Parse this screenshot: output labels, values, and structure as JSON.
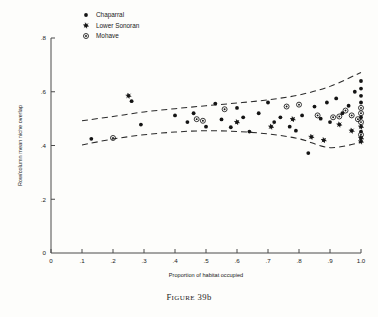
{
  "caption": {
    "prefix": "F",
    "rest": "IGURE",
    "number": " 39b"
  },
  "legend": {
    "position": "top-left-inside",
    "entries": [
      {
        "label": "Chaparral",
        "marker": "filled-dot"
      },
      {
        "label": "Lower Sonoran",
        "marker": "star-dot"
      },
      {
        "label": "Mohave",
        "marker": "circled-dot"
      }
    ]
  },
  "chart_data": {
    "type": "scatter",
    "title": "",
    "xlabel": "Proportion of habitat occupied",
    "ylabel": "Row/column mean niche overlap",
    "xlim": [
      0,
      1.0
    ],
    "ylim": [
      0,
      0.8
    ],
    "grid": false,
    "xticks": [
      0,
      0.1,
      0.2,
      0.3,
      0.4,
      0.5,
      0.6,
      0.7,
      0.8,
      0.9,
      1.0
    ],
    "xticklabels": [
      "0",
      ".1",
      ".2",
      ".3",
      ".4",
      ".5",
      ".6",
      ".7",
      ".8",
      ".9",
      "1.0"
    ],
    "yticks": [
      0,
      0.2,
      0.4,
      0.6,
      0.8
    ],
    "yticklabels": [
      "0",
      ".2",
      ".4",
      ".6",
      ".8"
    ],
    "series": [
      {
        "name": "Chaparral",
        "marker": "filled-dot",
        "points": [
          [
            0.13,
            0.425
          ],
          [
            0.26,
            0.565
          ],
          [
            0.29,
            0.478
          ],
          [
            0.4,
            0.512
          ],
          [
            0.44,
            0.487
          ],
          [
            0.46,
            0.52
          ],
          [
            0.5,
            0.47
          ],
          [
            0.53,
            0.556
          ],
          [
            0.55,
            0.497
          ],
          [
            0.58,
            0.468
          ],
          [
            0.6,
            0.54
          ],
          [
            0.62,
            0.505
          ],
          [
            0.64,
            0.452
          ],
          [
            0.67,
            0.52
          ],
          [
            0.7,
            0.56
          ],
          [
            0.72,
            0.487
          ],
          [
            0.74,
            0.505
          ],
          [
            0.77,
            0.47
          ],
          [
            0.79,
            0.455
          ],
          [
            0.81,
            0.512
          ],
          [
            0.83,
            0.372
          ],
          [
            0.85,
            0.545
          ],
          [
            0.87,
            0.5
          ],
          [
            0.89,
            0.56
          ],
          [
            0.9,
            0.487
          ],
          [
            0.92,
            0.575
          ],
          [
            0.94,
            0.52
          ],
          [
            0.96,
            0.548
          ],
          [
            0.98,
            0.6
          ],
          [
            1.0,
            0.64
          ],
          [
            1.0,
            0.612
          ],
          [
            1.0,
            0.585
          ],
          [
            1.0,
            0.56
          ],
          [
            1.0,
            0.505
          ],
          [
            1.0,
            0.452
          ]
        ]
      },
      {
        "name": "Lower Sonoran",
        "marker": "star-dot",
        "points": [
          [
            0.25,
            0.585
          ],
          [
            0.6,
            0.487
          ],
          [
            0.71,
            0.47
          ],
          [
            0.78,
            0.498
          ],
          [
            0.84,
            0.432
          ],
          [
            0.88,
            0.42
          ],
          [
            0.93,
            0.478
          ],
          [
            0.97,
            0.455
          ],
          [
            1.0,
            0.47
          ],
          [
            1.0,
            0.428
          ],
          [
            1.0,
            0.415
          ]
        ]
      },
      {
        "name": "Mohave",
        "marker": "circled-dot",
        "points": [
          [
            0.2,
            0.428
          ],
          [
            0.47,
            0.498
          ],
          [
            0.49,
            0.492
          ],
          [
            0.56,
            0.535
          ],
          [
            0.76,
            0.545
          ],
          [
            0.8,
            0.552
          ],
          [
            0.86,
            0.512
          ],
          [
            0.91,
            0.505
          ],
          [
            0.93,
            0.508
          ],
          [
            0.95,
            0.53
          ],
          [
            0.97,
            0.512
          ],
          [
            0.99,
            0.498
          ],
          [
            1.0,
            0.54
          ],
          [
            1.0,
            0.52
          ],
          [
            1.0,
            0.487
          ],
          [
            1.0,
            0.44
          ]
        ]
      }
    ],
    "bands": [
      {
        "name": "upper-confidence-band",
        "style": "dashed",
        "points": [
          [
            0.1,
            0.492
          ],
          [
            0.2,
            0.508
          ],
          [
            0.3,
            0.525
          ],
          [
            0.4,
            0.537
          ],
          [
            0.5,
            0.548
          ],
          [
            0.6,
            0.558
          ],
          [
            0.7,
            0.57
          ],
          [
            0.8,
            0.588
          ],
          [
            0.9,
            0.62
          ],
          [
            1.0,
            0.672
          ]
        ]
      },
      {
        "name": "lower-confidence-band",
        "style": "dashed",
        "points": [
          [
            0.1,
            0.402
          ],
          [
            0.2,
            0.424
          ],
          [
            0.3,
            0.44
          ],
          [
            0.4,
            0.45
          ],
          [
            0.5,
            0.455
          ],
          [
            0.6,
            0.452
          ],
          [
            0.7,
            0.443
          ],
          [
            0.8,
            0.425
          ],
          [
            0.9,
            0.392
          ],
          [
            1.0,
            0.412
          ]
        ]
      }
    ]
  }
}
